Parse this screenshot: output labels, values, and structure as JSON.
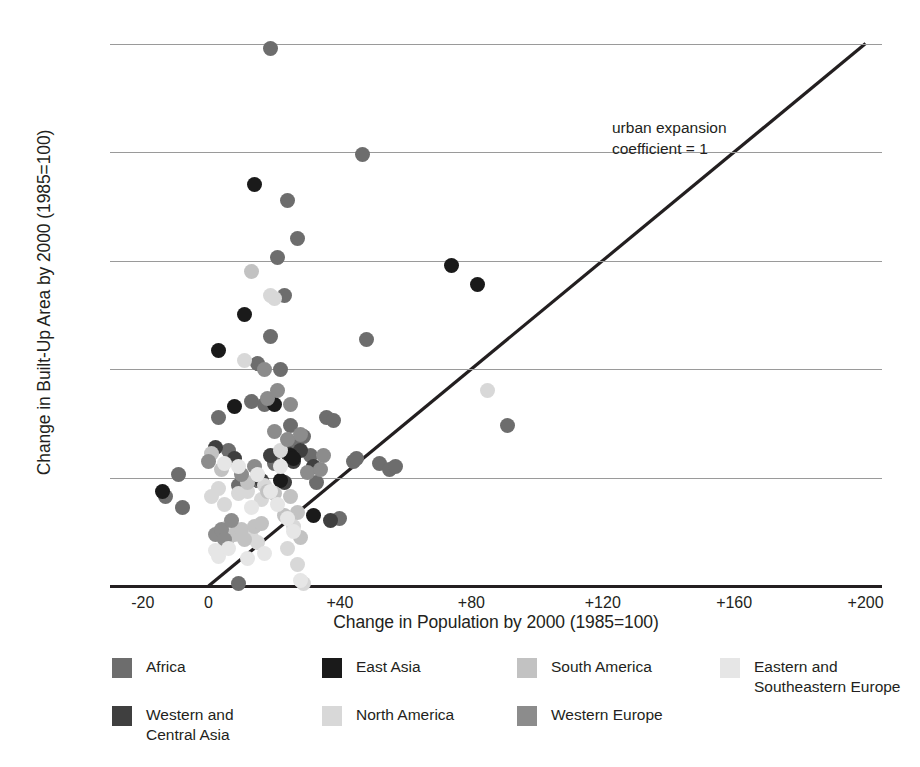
{
  "chart_data": {
    "type": "scatter",
    "title": "",
    "xlabel": "Change in Population by 2000 (1985=100)",
    "ylabel": "Change in Built-Up Area by 2000 (1985=100)",
    "xlim": [
      -30,
      205
    ],
    "ylim": [
      0,
      205
    ],
    "xticks": [
      "-20",
      "0",
      "+40",
      "+80",
      "+120",
      "+160",
      "+200"
    ],
    "xtickvalues": [
      -20,
      0,
      40,
      80,
      120,
      160,
      200
    ],
    "yticks": [
      "0",
      "+40",
      "+80",
      "+120",
      "+160",
      "+200"
    ],
    "ytickvalues": [
      0,
      40,
      80,
      120,
      160,
      200
    ],
    "grid": "horizontal",
    "legend_position": "below-plot",
    "annotation": "urban expansion\ncoefficient = 1",
    "reference_line": {
      "label": "urban expansion coefficient = 1",
      "from": [
        0,
        0
      ],
      "to": [
        200,
        200
      ],
      "color": "#231f20"
    },
    "series": [
      {
        "name": "Africa",
        "color": "#6d6d6d",
        "points": [
          [
            -13,
            33
          ],
          [
            -9,
            41
          ],
          [
            -8,
            29
          ],
          [
            3,
            62
          ],
          [
            6,
            50
          ],
          [
            9,
            37
          ],
          [
            9,
            1
          ],
          [
            13,
            68
          ],
          [
            15,
            82
          ],
          [
            15,
            39
          ],
          [
            17,
            67
          ],
          [
            19,
            92
          ],
          [
            19,
            198
          ],
          [
            20,
            45
          ],
          [
            21,
            121
          ],
          [
            22,
            80
          ],
          [
            23,
            107
          ],
          [
            24,
            142
          ],
          [
            25,
            59
          ],
          [
            26,
            52
          ],
          [
            27,
            128
          ],
          [
            29,
            55
          ],
          [
            31,
            48
          ],
          [
            33,
            38
          ],
          [
            36,
            62
          ],
          [
            38,
            61
          ],
          [
            40,
            25
          ],
          [
            44,
            46
          ],
          [
            45,
            47
          ],
          [
            47,
            159
          ],
          [
            48,
            91
          ],
          [
            52,
            45
          ],
          [
            55,
            43
          ],
          [
            57,
            44
          ],
          [
            91,
            59
          ]
        ]
      },
      {
        "name": "Western and Central Asia",
        "color": "#3f3f3f",
        "points": [
          [
            2,
            51
          ],
          [
            8,
            47
          ],
          [
            16,
            39
          ],
          [
            19,
            48
          ],
          [
            23,
            38
          ],
          [
            24,
            49
          ],
          [
            26,
            46
          ],
          [
            28,
            50
          ],
          [
            32,
            44
          ],
          [
            37,
            24
          ]
        ]
      },
      {
        "name": "East Asia",
        "color": "#1a1a1a",
        "points": [
          [
            -14,
            35
          ],
          [
            3,
            87
          ],
          [
            8,
            66
          ],
          [
            11,
            100
          ],
          [
            14,
            148
          ],
          [
            20,
            67
          ],
          [
            22,
            39
          ],
          [
            25,
            48
          ],
          [
            26,
            47
          ],
          [
            32,
            26
          ],
          [
            74,
            118
          ],
          [
            82,
            111
          ]
        ]
      },
      {
        "name": "North America",
        "color": "#d8d8d8",
        "points": [
          [
            1,
            33
          ],
          [
            3,
            36
          ],
          [
            5,
            30
          ],
          [
            6,
            22
          ],
          [
            7,
            20
          ],
          [
            9,
            34
          ],
          [
            11,
            83
          ],
          [
            12,
            35
          ],
          [
            13,
            18
          ],
          [
            15,
            16
          ],
          [
            16,
            32
          ],
          [
            17,
            37
          ],
          [
            19,
            107
          ],
          [
            20,
            106
          ],
          [
            22,
            50
          ],
          [
            24,
            14
          ],
          [
            26,
            22
          ],
          [
            27,
            8
          ],
          [
            29,
            1
          ],
          [
            85,
            72
          ]
        ]
      },
      {
        "name": "South America",
        "color": "#c2c2c2",
        "points": [
          [
            1,
            49
          ],
          [
            4,
            43
          ],
          [
            6,
            18
          ],
          [
            8,
            19
          ],
          [
            10,
            21
          ],
          [
            11,
            17
          ],
          [
            12,
            38
          ],
          [
            13,
            116
          ],
          [
            14,
            22
          ],
          [
            16,
            23
          ],
          [
            18,
            35
          ],
          [
            20,
            34
          ],
          [
            23,
            26
          ],
          [
            25,
            33
          ],
          [
            27,
            27
          ],
          [
            28,
            18
          ]
        ]
      },
      {
        "name": "Western Europe",
        "color": "#8c8c8c",
        "points": [
          [
            0,
            46
          ],
          [
            2,
            19
          ],
          [
            4,
            21
          ],
          [
            5,
            17
          ],
          [
            7,
            24
          ],
          [
            10,
            41
          ],
          [
            14,
            44
          ],
          [
            17,
            80
          ],
          [
            18,
            69
          ],
          [
            20,
            57
          ],
          [
            21,
            72
          ],
          [
            24,
            54
          ],
          [
            25,
            67
          ],
          [
            28,
            56
          ],
          [
            30,
            42
          ],
          [
            34,
            43
          ],
          [
            35,
            48
          ]
        ]
      },
      {
        "name": "Eastern and Southeastern Europe",
        "color": "#e6e6e6",
        "points": [
          [
            2,
            13
          ],
          [
            3,
            11
          ],
          [
            5,
            45
          ],
          [
            6,
            14
          ],
          [
            9,
            44
          ],
          [
            12,
            10
          ],
          [
            13,
            29
          ],
          [
            15,
            41
          ],
          [
            17,
            12
          ],
          [
            19,
            35
          ],
          [
            21,
            30
          ],
          [
            22,
            44
          ],
          [
            24,
            25
          ],
          [
            26,
            20
          ],
          [
            28,
            2
          ]
        ]
      }
    ]
  },
  "axes": {
    "x_title": "Change in Population by 2000 (1985=100)",
    "y_title": "Change in Built-Up Area by 2000 (1985=100)",
    "x_tick_labels": [
      "-20",
      "0",
      "+40",
      "+80",
      "+120",
      "+160",
      "+200"
    ],
    "y_tick_labels": [
      "0",
      "+40",
      "+80",
      "+120",
      "+160",
      "+200"
    ]
  },
  "annotation": {
    "line1": "urban expansion",
    "line2": "coefficient = 1"
  },
  "legend": {
    "items": [
      {
        "label": "Africa",
        "color": "#6d6d6d"
      },
      {
        "label": "East Asia",
        "color": "#1a1a1a"
      },
      {
        "label": "South America",
        "color": "#c2c2c2"
      },
      {
        "label": "Eastern and\nSoutheastern Europe",
        "color": "#e6e6e6"
      },
      {
        "label": "Western and\nCentral Asia",
        "color": "#3f3f3f"
      },
      {
        "label": "North America",
        "color": "#d8d8d8"
      },
      {
        "label": "Western Europe",
        "color": "#8c8c8c"
      }
    ]
  },
  "colors": {
    "axis": "#231f20",
    "gridline": "#9a9a9a",
    "background": "#ffffff"
  }
}
